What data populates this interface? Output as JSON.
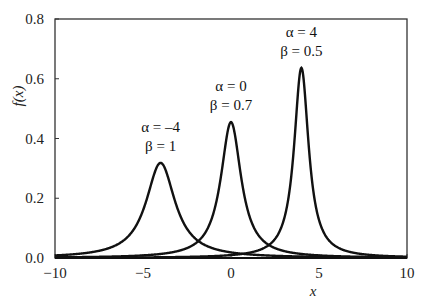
{
  "chart_data": {
    "type": "line",
    "title": "",
    "xlabel": "x",
    "ylabel": "f(x)",
    "xlim": [
      -10,
      10
    ],
    "ylim": [
      0,
      0.8
    ],
    "xticks": [
      -10,
      -5,
      0,
      5,
      10
    ],
    "xtick_labels": [
      "−10",
      "−5",
      "0",
      "5",
      "10"
    ],
    "yticks": [
      0.0,
      0.2,
      0.4,
      0.6,
      0.8
    ],
    "ytick_labels": [
      "0.0",
      "0.2",
      "0.4",
      "0.6",
      "0.8"
    ],
    "grid": false,
    "legend": null,
    "distribution": "Cauchy f(x) = 1 / (π β (1 + ((x − α)/β)²))",
    "series": [
      {
        "name": "α = −4, β = 1",
        "alpha": -4,
        "beta": 1,
        "peak_x": -4,
        "peak_y": 0.318
      },
      {
        "name": "α = 0, β = 0.7",
        "alpha": 0,
        "beta": 0.7,
        "peak_x": 0,
        "peak_y": 0.455
      },
      {
        "name": "α = 4, β = 0.5",
        "alpha": 4,
        "beta": 0.5,
        "peak_x": 4,
        "peak_y": 0.637
      }
    ],
    "annotations": [
      {
        "line1": "α = –4",
        "line2": "β = 1",
        "x": -4,
        "y": 0.36
      },
      {
        "line1": "α = 0",
        "line2": "β = 0.7",
        "x": 0,
        "y": 0.5
      },
      {
        "line1": "α = 4",
        "line2": "β = 0.5",
        "x": 4,
        "y": 0.68
      }
    ]
  },
  "labels": {
    "y_axis": "f(x)",
    "x_axis": "x"
  }
}
